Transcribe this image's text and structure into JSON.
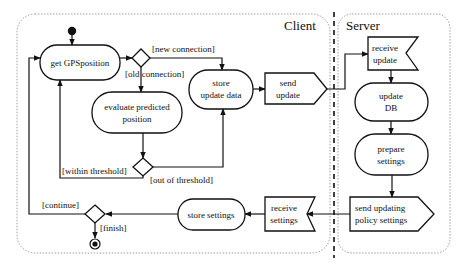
{
  "diagram": {
    "type": "UML activity diagram",
    "partitions": {
      "client": {
        "title": "Client"
      },
      "server": {
        "title": "Server"
      }
    },
    "nodes": {
      "get_gps": {
        "label": "get  GPSposition",
        "kind": "action"
      },
      "evaluate": {
        "line1": "evaluate predicted",
        "line2": "position",
        "kind": "action"
      },
      "store_update": {
        "line1": "store",
        "line2": "update data",
        "kind": "action"
      },
      "send_update": {
        "line1": "send",
        "line2": "update",
        "kind": "send-signal"
      },
      "receive_update": {
        "line1": "receive",
        "line2": "update",
        "kind": "receive-signal"
      },
      "update_db": {
        "line1": "update",
        "line2": "DB",
        "kind": "action"
      },
      "prepare_settings": {
        "line1": "prepare",
        "line2": "settings",
        "kind": "action"
      },
      "send_policy": {
        "line1": "send updating",
        "line2": "policy settings",
        "kind": "send-signal"
      },
      "receive_settings": {
        "line1": "receive",
        "line2": "settings",
        "kind": "receive-signal"
      },
      "store_settings": {
        "label": "store settings",
        "kind": "action"
      }
    },
    "guards": {
      "new_connection": "[new connection]",
      "old_connection": "[old connection]",
      "within_threshold": "[within threshold]",
      "out_of_threshold": "[out of  threshold]",
      "continue": "[continue]",
      "finish": "[finish]"
    },
    "colors": {
      "stroke": "#111111",
      "panel_border": "#888888",
      "background": "#ffffff"
    }
  }
}
